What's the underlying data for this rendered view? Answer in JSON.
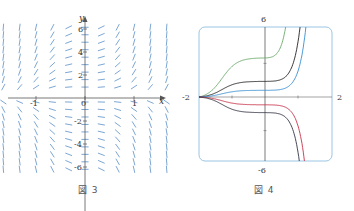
{
  "figures": [
    {
      "id": "fig3",
      "caption": "図 3",
      "description": "Direction field (slope field)"
    },
    {
      "id": "fig4",
      "caption": "図 4",
      "description": "Solution curves starting from x = -2"
    }
  ],
  "chart_data": [
    {
      "type": "scatter",
      "title": "",
      "subtitle": "Direction field",
      "caption": "図 3",
      "xlabel": "x",
      "ylabel": "y",
      "xlim": [
        -2,
        2
      ],
      "ylim": [
        -6,
        6
      ],
      "xticks": [
        -2,
        -1,
        0,
        1,
        2
      ],
      "xtick_labels": [
        "-2",
        "-1",
        "0",
        "1",
        "2"
      ],
      "yticks": [
        -6,
        -4,
        -2,
        2,
        4,
        6
      ],
      "ytick_labels": [
        "-6",
        "-4",
        "-2",
        "2",
        "4",
        "6"
      ],
      "grid": false,
      "field_color": "#5a8fc8",
      "grid_x": [
        -2.0,
        -1.67,
        -1.33,
        -1.0,
        -0.67,
        -0.33,
        0.0,
        0.33,
        0.67,
        1.0,
        1.33,
        1.67,
        2.0
      ],
      "grid_y": [
        -6,
        -5,
        -4,
        -3,
        -2,
        -1,
        1,
        2,
        3,
        4,
        5,
        6
      ],
      "notes": "Slopes near zero along y-axis region, steepening as |x| grows; positive slopes for y>0, negative for y<0"
    },
    {
      "type": "line",
      "title": "",
      "caption": "図 4",
      "xlabel": "",
      "ylabel": "",
      "xlim": [
        -2,
        2
      ],
      "ylim": [
        -6,
        6
      ],
      "axis_labels": {
        "left": "-2",
        "right": "2",
        "top": "6",
        "bottom": "-6"
      },
      "grid": false,
      "frame_color": "#7fb3d8",
      "series": [
        {
          "name": "green",
          "color": "#6aaa6a",
          "plateau_y": 3.5,
          "x": [
            -2,
            -1.5,
            -1,
            -0.5,
            0,
            0.5,
            0.8
          ],
          "y": [
            0,
            1.6,
            2.9,
            3.4,
            3.5,
            3.8,
            6
          ]
        },
        {
          "name": "black-upper",
          "color": "#222222",
          "plateau_y": 1.4,
          "x": [
            -2,
            -1.5,
            -1,
            -0.5,
            0,
            0.5,
            1.0,
            1.45
          ],
          "y": [
            0,
            0.6,
            1.1,
            1.35,
            1.4,
            1.5,
            2.2,
            6
          ]
        },
        {
          "name": "blue",
          "color": "#3a8fd0",
          "plateau_y": 0.6,
          "x": [
            -2,
            -1.5,
            -1,
            -0.5,
            0,
            0.5,
            1.0,
            1.6
          ],
          "y": [
            0,
            0.3,
            0.5,
            0.58,
            0.6,
            0.65,
            0.9,
            6
          ]
        },
        {
          "name": "red",
          "color": "#c8324a",
          "plateau_y": -0.7,
          "x": [
            -2,
            -1.5,
            -1,
            -0.5,
            0,
            0.5,
            1.0,
            1.6
          ],
          "y": [
            0,
            -0.4,
            -0.6,
            -0.68,
            -0.7,
            -0.75,
            -1.1,
            -6
          ]
        },
        {
          "name": "black-lower",
          "color": "#333344",
          "plateau_y": -1.4,
          "x": [
            -2,
            -1.5,
            -1,
            -0.5,
            0,
            0.5,
            1.0,
            1.45
          ],
          "y": [
            0,
            -0.6,
            -1.1,
            -1.35,
            -1.4,
            -1.5,
            -2.2,
            -6
          ]
        }
      ]
    }
  ]
}
